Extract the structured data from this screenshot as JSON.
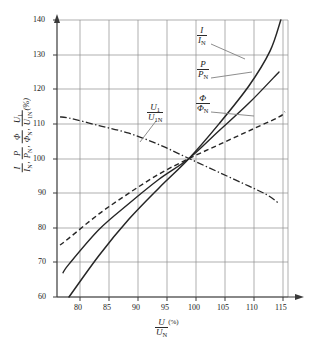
{
  "chart_data": {
    "type": "line",
    "title": "",
    "xlabel": "U/U_N (%)",
    "ylabel": "I/I_N, P/P_N, Φ/Φ_N, U_1/U_1N (%)",
    "xlim": [
      78,
      116.5
    ],
    "ylim": [
      60,
      140
    ],
    "xticks": [
      80,
      85,
      90,
      95,
      100,
      105,
      110,
      115
    ],
    "yticks": [
      60,
      70,
      80,
      90,
      100,
      110,
      120,
      130,
      140
    ],
    "grid": true,
    "legend_position": "inline-annotations",
    "series": [
      {
        "name": "I/I_N",
        "style": "solid",
        "label": "I/Iₙ",
        "points": [
          [
            80,
            60
          ],
          [
            85,
            72
          ],
          [
            90,
            82.5
          ],
          [
            95,
            91.5
          ],
          [
            100,
            100
          ],
          [
            105,
            110
          ],
          [
            110,
            121
          ],
          [
            113.5,
            131
          ],
          [
            115.3,
            140
          ]
        ]
      },
      {
        "name": "P/P_N",
        "style": "solid",
        "label": "P/Pₙ",
        "points": [
          [
            79,
            67
          ],
          [
            80,
            69.5
          ],
          [
            85,
            79.5
          ],
          [
            90,
            87
          ],
          [
            95,
            94
          ],
          [
            100,
            100
          ],
          [
            105,
            108
          ],
          [
            110,
            116
          ],
          [
            115,
            125
          ]
        ]
      },
      {
        "name": "Φ/Φ_N",
        "style": "dashed",
        "label": "Φ/Φₙ",
        "points": [
          [
            78.5,
            75
          ],
          [
            80,
            77
          ],
          [
            85,
            84
          ],
          [
            90,
            90
          ],
          [
            95,
            95.5
          ],
          [
            100,
            100
          ],
          [
            105,
            104
          ],
          [
            110,
            108
          ],
          [
            115,
            112
          ],
          [
            116,
            113.5
          ]
        ]
      },
      {
        "name": "U_1/U_1N",
        "style": "dashdot",
        "label": "U₁/U₁ₙ",
        "points": [
          [
            78.5,
            112
          ],
          [
            80,
            111.7
          ],
          [
            85,
            109.5
          ],
          [
            90,
            107.3
          ],
          [
            95,
            104
          ],
          [
            100,
            100
          ],
          [
            105,
            96
          ],
          [
            110,
            92
          ],
          [
            113,
            89.5
          ],
          [
            115,
            87
          ]
        ]
      }
    ],
    "annotations": [
      {
        "name": "I/I_N",
        "x": 108,
        "y": 135
      },
      {
        "name": "P/P_N",
        "x": 106,
        "y": 124
      },
      {
        "name": "Φ/Φ_N",
        "x": 106,
        "y": 114
      },
      {
        "name": "U_1/U_1N",
        "x": 93,
        "y": 110
      }
    ]
  },
  "axes": {
    "x_tick_labels": [
      "80",
      "85",
      "90",
      "95",
      "100",
      "105",
      "110",
      "115"
    ],
    "y_tick_labels": [
      "60",
      "70",
      "80",
      "90",
      "100",
      "110",
      "120",
      "130",
      "140"
    ],
    "x_axis_title_num": "U",
    "x_axis_title_den": "U",
    "x_axis_title_den_sub": "N",
    "x_axis_title_unit": "(%)",
    "y_axis_title": "(%)"
  },
  "curve_labels": {
    "current": {
      "num": "I",
      "den": "I",
      "den_sub": "N"
    },
    "power": {
      "num": "P",
      "den": "P",
      "den_sub": "N"
    },
    "flux": {
      "num": "Φ",
      "den": "Φ",
      "den_sub": "N"
    },
    "voltage": {
      "num_main": "U",
      "num_sub": "1",
      "den_main": "U",
      "den_sub": "1N"
    }
  },
  "y_axis_label_parts": {
    "p1_num": "I",
    "p1_den": "I",
    "p1_den_sub": "N",
    "p2_num": "P",
    "p2_den": "P",
    "p2_den_sub": "N",
    "p3_num": "Φ",
    "p3_den": "Φ",
    "p3_den_sub": "N",
    "p4_num": "U",
    "p4_num_sub": "1",
    "p4_den": "U",
    "p4_den_sub": "1N",
    "unit": "(%)"
  },
  "colors": {
    "grid": "#8c8c8c",
    "axis": "#3a3a3a",
    "curve": "#262626",
    "background": "#ffffff",
    "leader": "#777777"
  }
}
